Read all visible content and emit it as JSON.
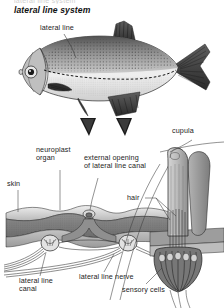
{
  "figure": {
    "title": "lateral line system",
    "cutoff_text_top": "lateral line system",
    "background_color": "#ffffff",
    "ink_color": "#232323"
  },
  "labels": {
    "lateral_line": "lateral line",
    "neuroplast_organ": "neuroplast\norgan",
    "external_opening": "external opening\nof lateral line canal",
    "skin": "skin",
    "cupula": "cupula",
    "hair": "hair",
    "lateral_line_canal": "lateral line\ncanal",
    "lateral_line_nerve": "lateral line nerve",
    "sensory_cells": "sensory cells"
  },
  "panels": {
    "fish": {
      "name": "fish-illustration",
      "description": "bream-like fish in side view with dashed lateral line"
    },
    "cross_section": {
      "name": "skin-cross-section",
      "description": "cut-away of fish skin showing lateral line canal and neuroplast organs"
    },
    "cupula_detail": {
      "name": "cupula-detail",
      "description": "magnified neuroplast organ with cupula, hairs and sensory cells"
    }
  },
  "icons": {
    "arrow_left": "arrow-down-icon",
    "arrow_right": "arrow-down-icon"
  }
}
